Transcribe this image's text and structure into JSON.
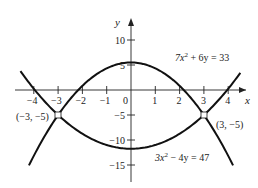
{
  "chart_data": {
    "type": "line",
    "title": "",
    "xlabel": "x",
    "ylabel": "y",
    "xlim": [
      -4.6,
      4.6
    ],
    "ylim": [
      -18,
      12
    ],
    "x_ticks": [
      -4,
      -3,
      -2,
      -1,
      0,
      1,
      2,
      3,
      4
    ],
    "x_tick_labels": [
      "−4",
      "−3",
      "−2",
      "−1",
      "0",
      "1",
      "2",
      "3",
      "4"
    ],
    "y_ticks": [
      10,
      5,
      -5,
      -10,
      -15
    ],
    "y_tick_labels": [
      "10",
      "5",
      "−5",
      "−10",
      "−15"
    ],
    "grid": false,
    "series": [
      {
        "name": "7x^2 + 6y = 33",
        "label_text": "7x² + 6y = 33",
        "equation": "y = (33 - 7x^2)/6",
        "x": [
          -4.4,
          -4,
          -3,
          -2,
          -1,
          0,
          1,
          2,
          3,
          4,
          4.4
        ],
        "y": [
          -17.09,
          -13.17,
          -5,
          0.83,
          4.33,
          5.5,
          4.33,
          0.83,
          -5,
          -13.17,
          -17.09
        ]
      },
      {
        "name": "3x^2 - 4y = 47",
        "label_text": "3x² − 4y = 47",
        "equation": "y = (3x^2 - 47)/4",
        "x": [
          -4.6,
          -4,
          -3,
          -2,
          -1,
          0,
          1,
          2,
          3,
          4,
          4.6
        ],
        "y": [
          4.12,
          0.25,
          -5,
          -8.75,
          -11,
          -11.75,
          -11,
          -8.75,
          -5,
          0.25,
          4.12
        ]
      }
    ],
    "annotations": [
      {
        "text": "(−3, −5)",
        "x": -3,
        "y": -5
      },
      {
        "text": "(3, −5)",
        "x": 3,
        "y": -5
      }
    ]
  },
  "axes": {
    "x_label": "x",
    "y_label": "y"
  },
  "labels": {
    "curve1": "7x",
    "curve1_sup": "2",
    "curve1_rest": " + 6y = 33",
    "curve2": "3x",
    "curve2_sup": "2",
    "curve2_rest": " − 4y = 47",
    "pt_left": "(−3, −5)",
    "pt_right": "(3, −5)"
  }
}
